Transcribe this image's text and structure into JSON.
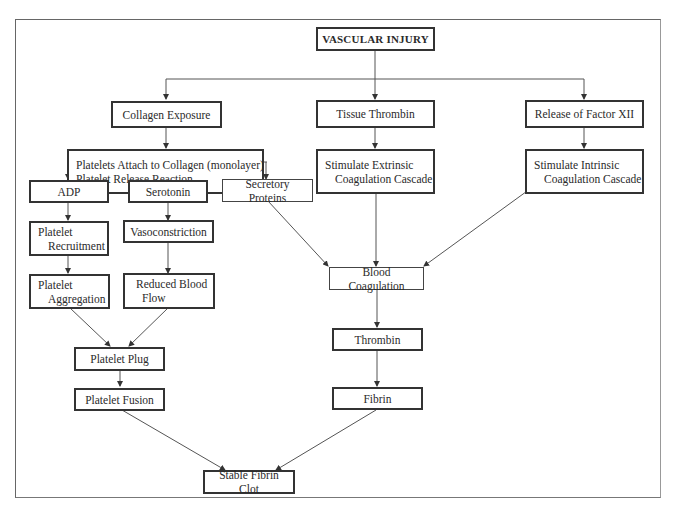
{
  "diagram": {
    "title": "VASCULAR INJURY",
    "nodes": {
      "vascular_injury": "VASCULAR INJURY",
      "collagen_exposure": "Collagen Exposure",
      "tissue_thrombin": "Tissue Thrombin",
      "release_factor_xii": "Release of Factor XII",
      "platelets_attach": {
        "line1": "Platelets Attach to Collagen (monolayer)",
        "line2": "Platelet Release Reaction"
      },
      "stimulate_extrinsic": {
        "line1": "Stimulate Extrinsic",
        "line2": "Coagulation Cascade"
      },
      "stimulate_intrinsic": {
        "line1": "Stimulate Intrinsic",
        "line2": "Coagulation Cascade"
      },
      "adp": "ADP",
      "serotonin": "Serotonin",
      "secretory_proteins": "Secretory Proteins",
      "platelet_recruitment": {
        "line1": "Platelet",
        "line2": "Recruitment"
      },
      "vasoconstriction": "Vasoconstriction",
      "platelet_aggregation": {
        "line1": "Platelet",
        "line2": "Aggregation"
      },
      "reduced_blood_flow": {
        "line1": "Reduced Blood",
        "line2": "Flow"
      },
      "blood_coagulation": "Blood Coagulation",
      "thrombin": "Thrombin",
      "platelet_plug": "Platelet Plug",
      "platelet_fusion": "Platelet Fusion",
      "fibrin": "Fibrin",
      "stable_fibrin_clot": "Stable Fibrin Clot"
    },
    "edges": [
      [
        "VASCULAR INJURY",
        "Collagen Exposure"
      ],
      [
        "VASCULAR INJURY",
        "Tissue Thrombin"
      ],
      [
        "VASCULAR INJURY",
        "Release of Factor XII"
      ],
      [
        "Collagen Exposure",
        "Platelets Attach to Collagen (monolayer) / Platelet Release Reaction"
      ],
      [
        "Tissue Thrombin",
        "Stimulate Extrinsic Coagulation Cascade"
      ],
      [
        "Release of Factor XII",
        "Stimulate Intrinsic Coagulation Cascade"
      ],
      [
        "Platelet Release Reaction",
        "ADP"
      ],
      [
        "Platelet Release Reaction",
        "Serotonin"
      ],
      [
        "Platelet Release Reaction",
        "Secretory Proteins"
      ],
      [
        "ADP",
        "Platelet Recruitment"
      ],
      [
        "Platelet Recruitment",
        "Platelet Aggregation"
      ],
      [
        "Serotonin",
        "Vasoconstriction"
      ],
      [
        "Vasoconstriction",
        "Reduced Blood Flow"
      ],
      [
        "Platelet Aggregation",
        "Platelet Plug"
      ],
      [
        "Reduced Blood Flow",
        "Platelet Plug"
      ],
      [
        "Platelet Plug",
        "Platelet Fusion"
      ],
      [
        "Secretory Proteins",
        "Blood Coagulation"
      ],
      [
        "Stimulate Extrinsic Coagulation Cascade",
        "Blood Coagulation"
      ],
      [
        "Stimulate Intrinsic Coagulation Cascade",
        "Blood Coagulation"
      ],
      [
        "Blood Coagulation",
        "Thrombin"
      ],
      [
        "Thrombin",
        "Fibrin"
      ],
      [
        "Platelet Fusion",
        "Stable Fibrin Clot"
      ],
      [
        "Fibrin",
        "Stable Fibrin Clot"
      ]
    ]
  }
}
